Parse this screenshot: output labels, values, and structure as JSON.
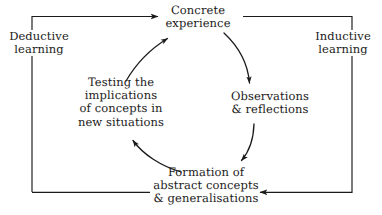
{
  "diagram": {
    "background_color": "#ffffff",
    "ink_color": "#1c1b1a",
    "nodes": {
      "concrete_experience": "Concrete\nexperience",
      "observations_reflections": "Observations\n& reflections",
      "formation_abstract_concepts": "Formation of\nabstract concepts\n& generalisations",
      "testing_implications": "Testing the\nimplications\nof concepts in\nnew situations"
    },
    "side_labels": {
      "deductive": "Deductive\nlearning",
      "inductive": "Inductive\nlearning"
    },
    "cycle_direction": "clockwise",
    "inner_arrows": [
      {
        "name": "concrete-to-observations",
        "from": "concrete_experience",
        "to": "observations_reflections",
        "path": "M 224 33 C 238 46 248 64 249 84",
        "arrow_angle": 80
      },
      {
        "name": "observations-to-formation",
        "from": "observations_reflections",
        "to": "formation_abstract_concepts",
        "path": "M 253 124 C 252 140 247 152 240 161",
        "arrow_angle": 128
      },
      {
        "name": "formation-to-testing",
        "from": "formation_abstract_concepts",
        "to": "testing_implications",
        "path": "M 180 172 C 160 166 142 154 132 140",
        "arrow_angle": 235
      },
      {
        "name": "testing-to-concrete",
        "from": "testing_implications",
        "to": "concrete_experience",
        "path": "M 127 80 C 138 62 152 48 168 38",
        "arrow_angle": 326
      }
    ],
    "outer_arrows": [
      {
        "name": "deductive-bracket",
        "label": "deductive",
        "path": "M 32 192 L 32 16 L 160 16",
        "arrow_at": {
          "x": 160,
          "y": 16
        },
        "arrow_angle": 0
      },
      {
        "name": "inductive-bracket",
        "label": "inductive",
        "path": "M 240 17 L 352 17 L 352 192 L 258 192",
        "arrow_at": {
          "x": 258,
          "y": 192
        },
        "arrow_angle": 180
      },
      {
        "name": "bottom-connector",
        "label": "",
        "path": "M 32 192 L 140 192",
        "arrow_at": null,
        "arrow_angle": 0
      }
    ],
    "stroke_width": 1.15
  }
}
